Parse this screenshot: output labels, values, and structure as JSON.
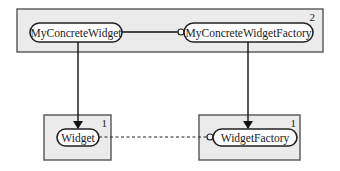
{
  "diagram": {
    "type": "component-dependency",
    "groups": [
      {
        "id": "top",
        "number": "2",
        "components": [
          {
            "id": "my-concrete-widget",
            "label": "MyConcreteWidget"
          },
          {
            "id": "my-concrete-widget-factory",
            "label": "MyConcreteWidgetFactory"
          }
        ]
      },
      {
        "id": "bottom-left",
        "number": "1",
        "components": [
          {
            "id": "widget",
            "label": "Widget"
          }
        ]
      },
      {
        "id": "bottom-right",
        "number": "1",
        "components": [
          {
            "id": "widget-factory",
            "label": "WidgetFactory"
          }
        ]
      }
    ],
    "edges": [
      {
        "from": "my-concrete-widget",
        "to": "my-concrete-widget-factory",
        "style": "solid",
        "end": "socket"
      },
      {
        "from": "my-concrete-widget",
        "to": "widget",
        "style": "solid",
        "end": "arrow"
      },
      {
        "from": "my-concrete-widget-factory",
        "to": "widget-factory",
        "style": "solid",
        "end": "arrow"
      },
      {
        "from": "widget",
        "to": "widget-factory",
        "style": "dashed",
        "end": "socket"
      }
    ],
    "colors": {
      "group_fill": "#ebebeb",
      "group_stroke": "#555555",
      "pill_fill": "#ffffff",
      "line": "#111111"
    }
  }
}
